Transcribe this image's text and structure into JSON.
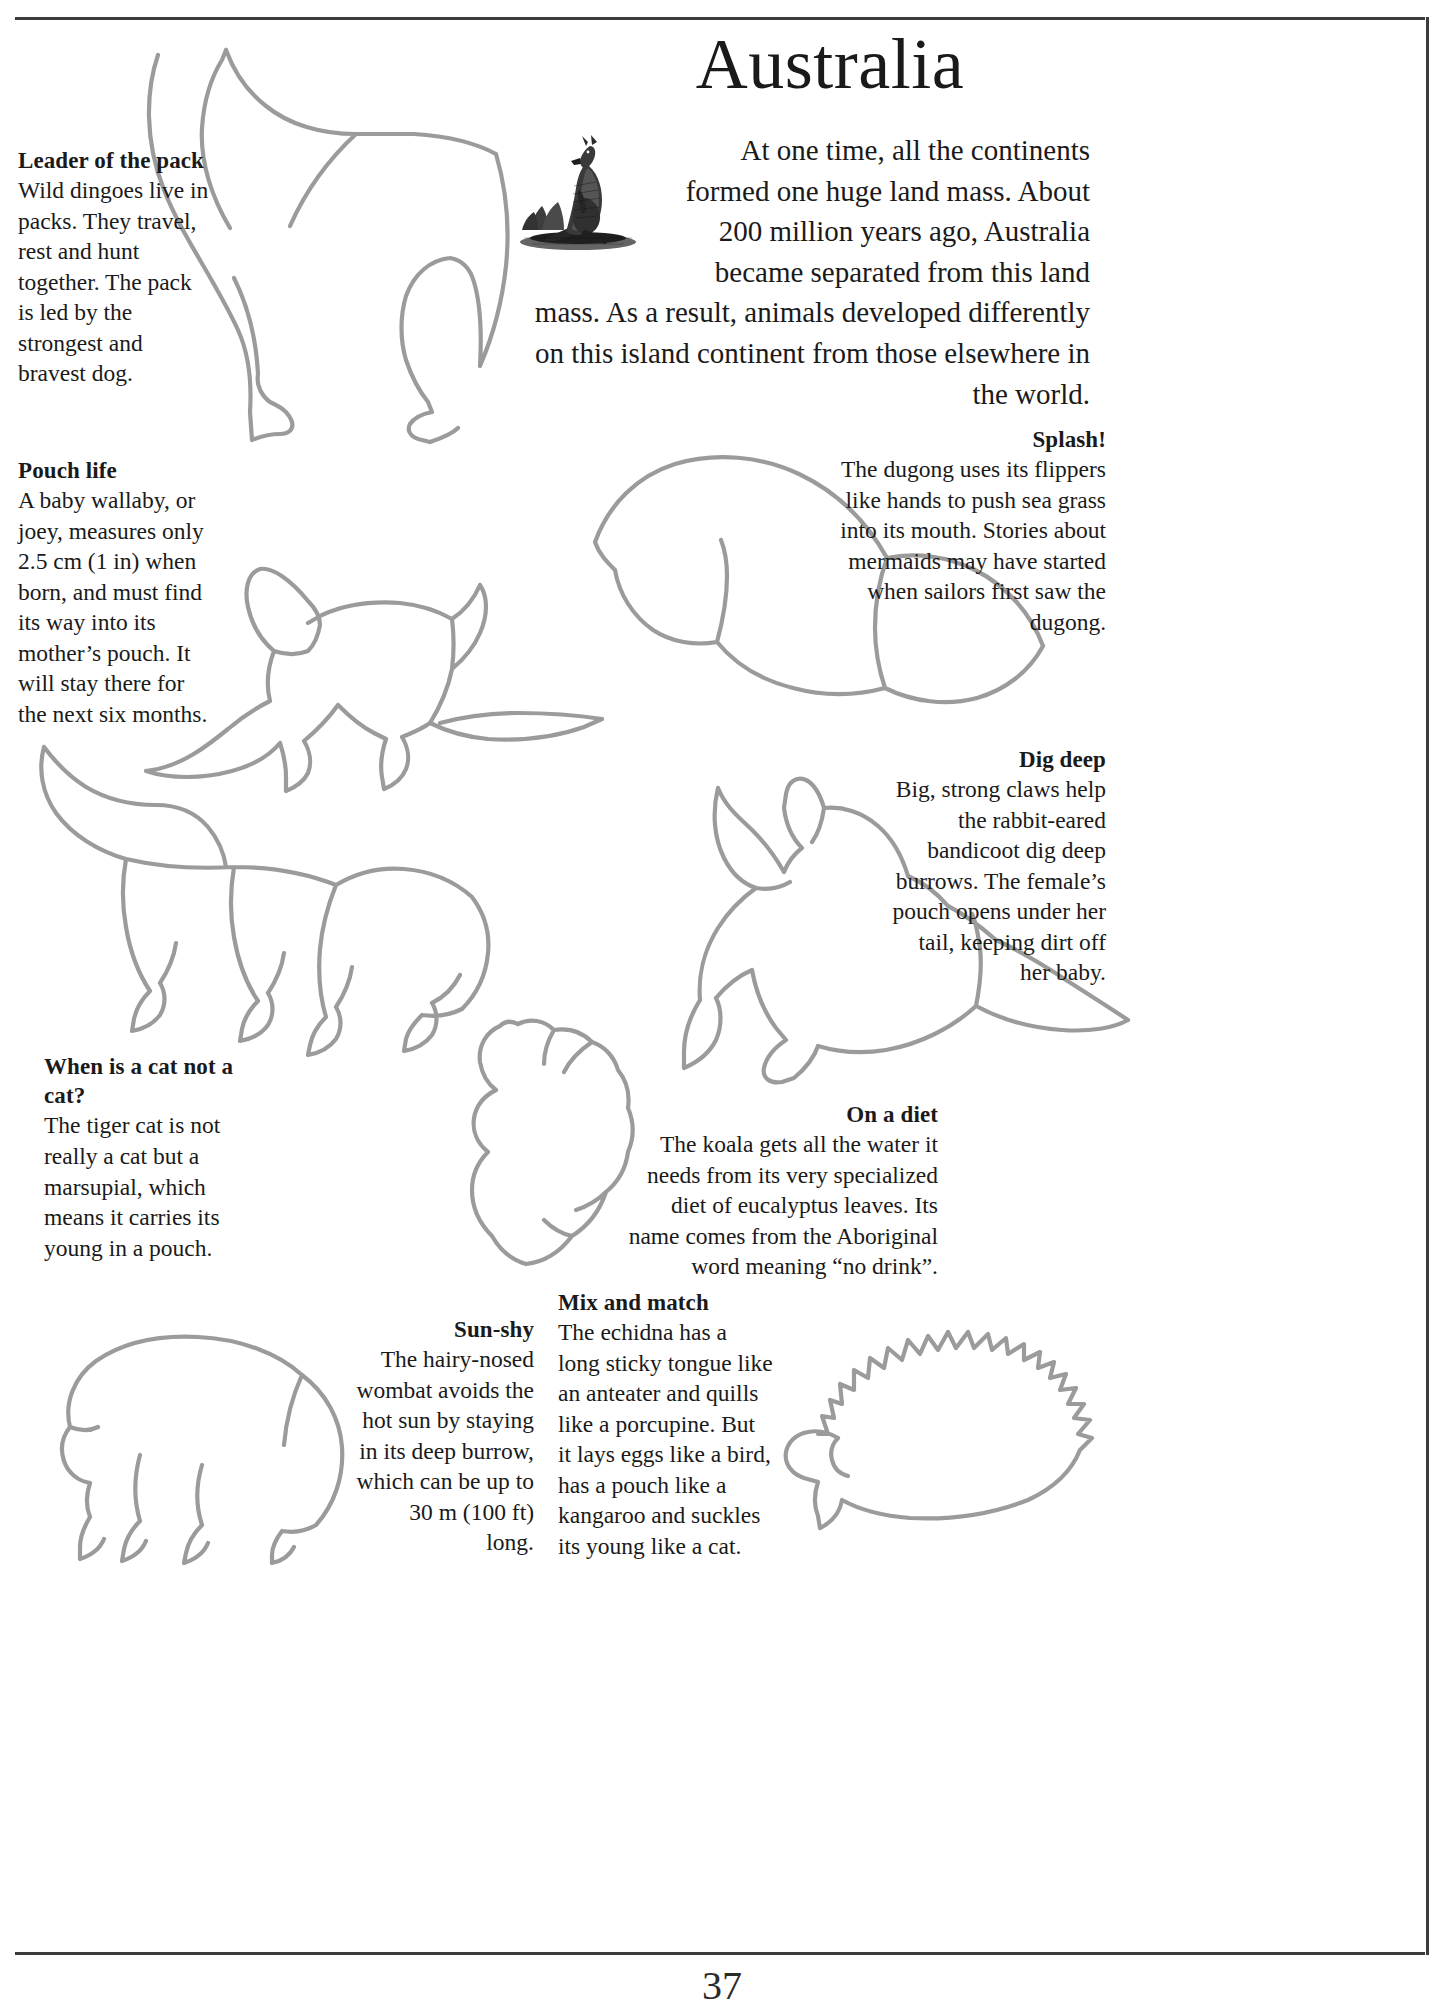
{
  "page": {
    "title": "Australia",
    "number": "37",
    "intro_paragraph": "At one time, all the continents formed one huge land mass. About 200 million years ago, Australia became separated from this land mass. As a result, animals developed differently on this island continent from those elsewhere in the world.",
    "illustration_caption_icon": "kangaroo-engraving"
  },
  "facts": [
    {
      "id": "leader-of-the-pack",
      "heading": "Leader of the pack",
      "body": "Wild dingoes live in packs. They travel, rest and hunt together. The pack is led by the strongest and bravest dog.",
      "align": "left",
      "animal": "dingo"
    },
    {
      "id": "pouch-life",
      "heading": "Pouch life",
      "body": "A baby wallaby, or joey, measures only 2.5 cm (1 in) when born, and must find its way into its mother’s pouch. It will stay there for the next six months.",
      "align": "left",
      "animal": "wallaby"
    },
    {
      "id": "splash",
      "heading": "Splash!",
      "body": "The dugong uses its flippers like hands to push sea grass into its mouth. Stories about mermaids may have started when sailors first saw the dugong.",
      "align": "right",
      "animal": "dugong"
    },
    {
      "id": "dig-deep",
      "heading": "Dig deep",
      "body": "Big, strong claws help the rabbit-eared bandicoot dig deep burrows. The female’s pouch opens under her tail, keeping dirt off her baby.",
      "align": "right",
      "animal": "bandicoot"
    },
    {
      "id": "when-is-a-cat-not-a-cat",
      "heading": "When is a cat not a cat?",
      "body": "The tiger cat is not really a cat but a marsupial, which means it carries its young in a pouch.",
      "align": "left",
      "animal": "tiger-cat"
    },
    {
      "id": "on-a-diet",
      "heading": "On a diet",
      "body": "The koala gets all the water it needs from its very specialized diet of eucalyptus leaves. Its name comes from the Aboriginal word meaning “no drink”.",
      "align": "right",
      "animal": "koala"
    },
    {
      "id": "sun-shy",
      "heading": "Sun-shy",
      "body": "The hairy-nosed wombat avoids the hot sun by staying in its deep burrow, which can be up to 30 m (100 ft) long.",
      "align": "right",
      "animal": "wombat"
    },
    {
      "id": "mix-and-match",
      "heading": "Mix and match",
      "body": "The echidna has a long sticky tongue like an anteater and quills like a porcupine. But it lays eggs like a bird, has a pouch like a kangaroo and suckles its young like a cat.",
      "align": "left",
      "animal": "echidna"
    }
  ],
  "colors": {
    "outline": "#9b9b9b",
    "text": "#1a1a1a",
    "frame": "#3c3c3c",
    "background": "#ffffff"
  }
}
